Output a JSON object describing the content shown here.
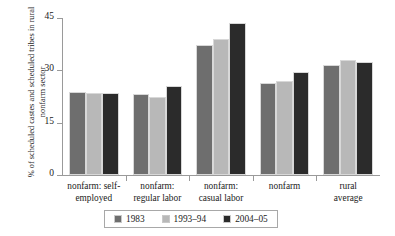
{
  "chart_data": {
    "type": "bar",
    "title": "",
    "xlabel": "",
    "ylabel": "% of scheduled castes and scheduled tribes in rural nonfarm sector",
    "ylim": [
      0,
      45
    ],
    "yticks": [
      0,
      15,
      30,
      45
    ],
    "ytick_labels": [
      "0",
      "15",
      "30",
      "45"
    ],
    "grid": false,
    "legend_position": "bottom-center",
    "categories": [
      "nonfarm: self-employed",
      "nonfarm: regular labor",
      "nonfarm: casual labor",
      "nonfarm",
      "rural average"
    ],
    "category_lines": [
      [
        "nonfarm: self-",
        "employed"
      ],
      [
        "nonfarm:",
        "regular labor"
      ],
      [
        "nonfarm:",
        "casual labor"
      ],
      [
        "nonfarm",
        ""
      ],
      [
        "rural",
        "average"
      ]
    ],
    "series": [
      {
        "name": "1983",
        "color": "#6e6e6e",
        "values": [
          23.8,
          23.2,
          37.2,
          26.5,
          31.5
        ]
      },
      {
        "name": "1993–94",
        "color": "#b8b8b8",
        "values": [
          23.5,
          22.5,
          39.0,
          27.0,
          33.0
        ]
      },
      {
        "name": "2004–05",
        "color": "#2b2b2b",
        "values": [
          23.6,
          25.5,
          43.5,
          29.5,
          32.5
        ]
      }
    ]
  },
  "legend": {
    "items": [
      {
        "label": "1983"
      },
      {
        "label": "1993–94"
      },
      {
        "label": "2004–05"
      }
    ]
  }
}
